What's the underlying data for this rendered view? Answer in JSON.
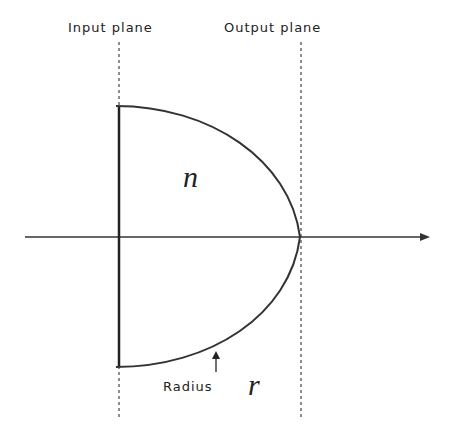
{
  "labels": {
    "input_plane": "Input plane",
    "output_plane": "Output plane",
    "index_symbol": "n",
    "radius_label": "Radius",
    "radius_symbol": "r"
  },
  "colors": {
    "line": "#333333",
    "background": "#ffffff"
  }
}
